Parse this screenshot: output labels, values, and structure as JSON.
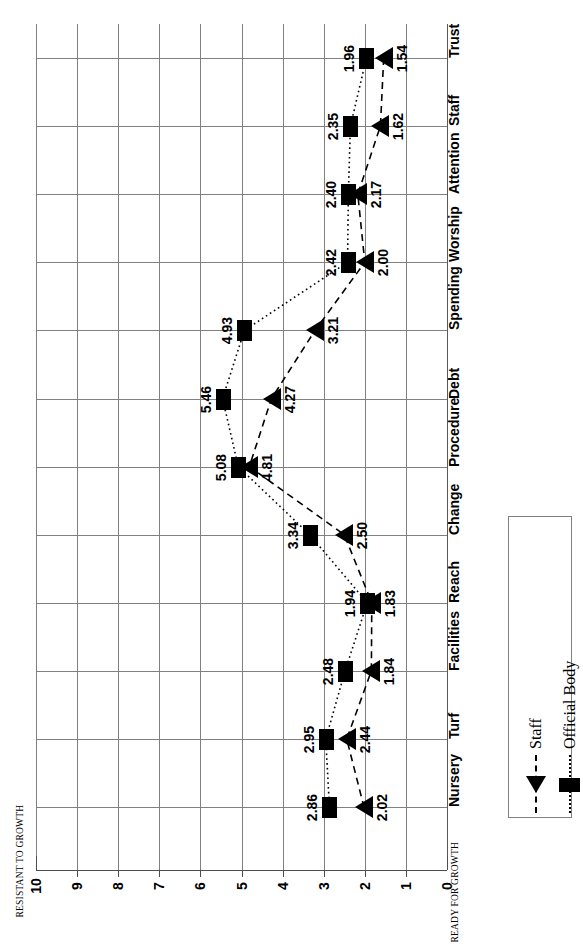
{
  "chart_data": {
    "type": "line",
    "orientation": "horizontal-rotated",
    "title": "",
    "xlabel": "",
    "ylabel": "",
    "axis_min_label": "READY FOR GROWTH",
    "axis_max_label": "RESISTANT TO GROWTH",
    "value_axis_range": [
      0,
      10
    ],
    "value_axis_ticks": [
      "10",
      "9",
      "8",
      "7",
      "6",
      "5",
      "4",
      "3",
      "2",
      "1",
      "0"
    ],
    "grid": true,
    "legend_position": "bottom-right",
    "categories": [
      "Trust",
      "Staff",
      "Attention",
      "Worship",
      "Spending",
      "Debt",
      "Procedure",
      "Change",
      "Reach",
      "Facilities",
      "Turf",
      "Nursery"
    ],
    "series": [
      {
        "name": "Official Body",
        "marker": "square",
        "line_style": "dotted",
        "values": [
          1.96,
          2.35,
          2.4,
          2.42,
          4.93,
          5.46,
          5.08,
          3.34,
          1.94,
          2.48,
          2.95,
          2.86
        ],
        "labels": [
          "1.96",
          "2.35",
          "2.40",
          "2.42",
          "4.93",
          "5.46",
          "5.08",
          "3.34",
          "1.94",
          "2.48",
          "2.95",
          "2.86"
        ]
      },
      {
        "name": "Staff",
        "marker": "triangle",
        "line_style": "dashed",
        "values": [
          1.54,
          1.62,
          2.17,
          2.0,
          3.21,
          4.27,
          4.81,
          2.5,
          1.83,
          1.84,
          2.44,
          2.02
        ],
        "labels": [
          "1.54",
          "1.62",
          "2.17",
          "2.00",
          "3.21",
          "4.27",
          "4.81",
          "2.50",
          "1.83",
          "1.84",
          "2.44",
          "2.02"
        ]
      }
    ],
    "colors": {
      "series": "#000000",
      "grid": "#808080",
      "axis": "#4d4d4d"
    }
  },
  "legend": {
    "items": [
      {
        "label": "Official Body",
        "marker": "square-marker",
        "style": "dotted"
      },
      {
        "label": "Staff",
        "marker": "triangle-marker",
        "style": "dashed"
      }
    ]
  }
}
